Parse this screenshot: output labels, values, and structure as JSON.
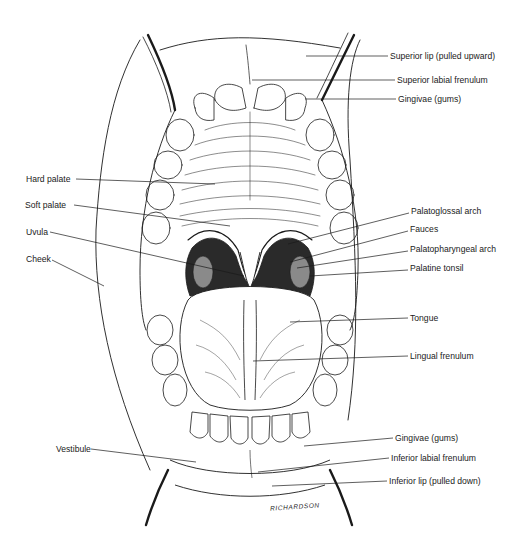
{
  "figure": {
    "signature": "RICHARDSON",
    "colors": {
      "ink": "#1a1a1a",
      "background": "#ffffff",
      "shade": "#2a2a2a"
    }
  },
  "labels": {
    "right": [
      {
        "id": "superior-lip",
        "text": "Superior lip (pulled upward)",
        "x": 390,
        "y": 56,
        "line": [
          [
            306,
            56
          ],
          [
            388,
            56
          ]
        ]
      },
      {
        "id": "superior-labial-frenulum",
        "text": "Superior labial frenulum",
        "x": 397,
        "y": 80,
        "line": [
          [
            252,
            80
          ],
          [
            395,
            80
          ]
        ]
      },
      {
        "id": "gingivae-upper",
        "text": "Gingivae (gums)",
        "x": 398,
        "y": 99,
        "line": [
          [
            305,
            99
          ],
          [
            396,
            99
          ]
        ]
      },
      {
        "id": "palatoglossal-arch",
        "text": "Palatoglossal arch",
        "x": 411,
        "y": 211,
        "line": [
          [
            288,
            244
          ],
          [
            409,
            213
          ]
        ]
      },
      {
        "id": "fauces",
        "text": "Fauces",
        "x": 410,
        "y": 229,
        "line": [
          [
            290,
            262
          ],
          [
            408,
            231
          ]
        ]
      },
      {
        "id": "palatopharyngeal-arch",
        "text": "Palatopharyngeal arch",
        "x": 410,
        "y": 249,
        "line": [
          [
            297,
            268
          ],
          [
            408,
            251
          ]
        ]
      },
      {
        "id": "palatine-tonsil",
        "text": "Palatine tonsil",
        "x": 410,
        "y": 268,
        "line": [
          [
            310,
            276
          ],
          [
            408,
            270
          ]
        ]
      },
      {
        "id": "tongue",
        "text": "Tongue",
        "x": 410,
        "y": 316,
        "line": [
          [
            290,
            322
          ],
          [
            408,
            318
          ]
        ]
      },
      {
        "id": "lingual-frenulum",
        "text": "Lingual frenulum",
        "x": 410,
        "y": 351,
        "line": [
          [
            253,
            361
          ],
          [
            408,
            356
          ]
        ]
      },
      {
        "id": "gingivae-lower",
        "text": "Gingivae (gums)",
        "x": 395,
        "y": 435,
        "line": [
          [
            304,
            446
          ],
          [
            393,
            438
          ]
        ]
      },
      {
        "id": "inferior-labial-frenulum",
        "text": "Inferior labial frenulum",
        "x": 391,
        "y": 455,
        "line": [
          [
            258,
            472
          ],
          [
            389,
            458
          ]
        ]
      },
      {
        "id": "inferior-lip",
        "text": "Inferior lip (pulled down)",
        "x": 389,
        "y": 478,
        "line": [
          [
            272,
            486
          ],
          [
            387,
            481
          ]
        ]
      }
    ],
    "left": [
      {
        "id": "hard-palate",
        "text": "Hard palate",
        "x": 26,
        "y": 174,
        "line": [
          [
            76,
            179
          ],
          [
            215,
            184
          ]
        ]
      },
      {
        "id": "soft-palate",
        "text": "Soft palate",
        "x": 26,
        "y": 201,
        "line": [
          [
            74,
            205
          ],
          [
            230,
            226
          ]
        ]
      },
      {
        "id": "uvula",
        "text": "Uvula",
        "x": 26,
        "y": 228,
        "line": [
          [
            50,
            232
          ],
          [
            244,
            276
          ]
        ]
      },
      {
        "id": "cheek",
        "text": "Cheek",
        "x": 26,
        "y": 255,
        "line": [
          [
            52,
            260
          ],
          [
            104,
            286
          ]
        ]
      },
      {
        "id": "vestibule",
        "text": "Vestibule",
        "x": 56,
        "y": 444,
        "line": [
          [
            91,
            449
          ],
          [
            196,
            462
          ]
        ]
      }
    ]
  }
}
